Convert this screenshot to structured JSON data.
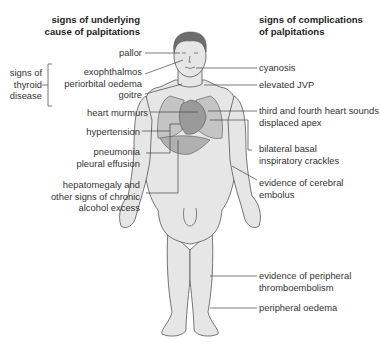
{
  "left_heading": {
    "line1": "signs of underlying",
    "line2": "cause of palpitations"
  },
  "right_heading": {
    "line1": "signs of complications",
    "line2": "of palpitations"
  },
  "thyroid_group": {
    "line1": "signs of",
    "line2": "thyroid",
    "line3": "disease"
  },
  "left_labels": [
    {
      "id": "pallor",
      "lines": [
        "pallor"
      ]
    },
    {
      "id": "exophthalmos",
      "lines": [
        "exophthalmos",
        "periorbital oedema"
      ]
    },
    {
      "id": "goitre",
      "lines": [
        "goitre"
      ]
    },
    {
      "id": "heart-murmurs",
      "lines": [
        "heart murmurs"
      ]
    },
    {
      "id": "hypertension",
      "lines": [
        "hypertension"
      ]
    },
    {
      "id": "pneumonia",
      "lines": [
        "pneumonia",
        "pleural effusion"
      ]
    },
    {
      "id": "hepatomegaly",
      "lines": [
        "hepatomegaly and",
        "other signs of chronic",
        "alcohol excess"
      ]
    }
  ],
  "right_labels": [
    {
      "id": "cyanosis",
      "lines": [
        "cyanosis"
      ]
    },
    {
      "id": "elevated-jvp",
      "lines": [
        "elevated JVP"
      ]
    },
    {
      "id": "heart-sounds",
      "lines": [
        "third and fourth heart sounds",
        "displaced apex"
      ]
    },
    {
      "id": "crackles",
      "lines": [
        "bilateral  basal",
        "inspiratory crackles"
      ]
    },
    {
      "id": "cerebral-embolus",
      "lines": [
        "evidence of cerebral",
        "embolus"
      ]
    },
    {
      "id": "peripheral-thromboembolism",
      "lines": [
        "evidence of peripheral",
        "thromboembolism"
      ]
    },
    {
      "id": "peripheral-oedema",
      "lines": [
        "peripheral oedema"
      ]
    }
  ],
  "colors": {
    "body_fill": "#e6e6e6",
    "outline": "#555555",
    "organ_fill": "#b8b8b8",
    "hair": "#6e6e6e",
    "leader_line": "#444444"
  }
}
